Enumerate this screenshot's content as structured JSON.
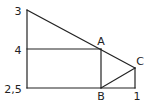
{
  "diagram": {
    "type": "geometry-figure",
    "stroke_color": "#222222",
    "background": "#ffffff",
    "labels": {
      "left_top": "3",
      "left_mid": "4",
      "left_bottom": "2,5",
      "point_a": "A",
      "point_b": "B",
      "point_c": "C",
      "bottom_right": "1"
    },
    "points": {
      "top_left": [
        27,
        10
      ],
      "mid_left": [
        27,
        49
      ],
      "bottom_left": [
        27,
        88
      ],
      "A": [
        101,
        49
      ],
      "B": [
        101,
        88
      ],
      "C": [
        135,
        68
      ],
      "bottom_right": [
        135,
        88
      ]
    },
    "segments": [
      {
        "from": "top_left",
        "to": "bottom_left"
      },
      {
        "from": "bottom_left",
        "to": "bottom_right"
      },
      {
        "from": "bottom_right",
        "to": "C"
      },
      {
        "from": "top_left",
        "to": "C"
      },
      {
        "from": "mid_left",
        "to": "A"
      },
      {
        "from": "A",
        "to": "B"
      },
      {
        "from": "B",
        "to": "C"
      }
    ]
  }
}
